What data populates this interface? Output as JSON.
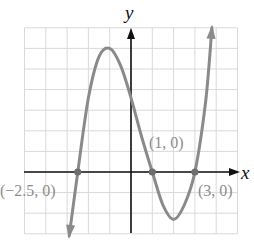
{
  "chart_data": {
    "type": "line",
    "title": "",
    "xlabel": "x",
    "ylabel": "y",
    "xlim": [
      -5,
      5
    ],
    "ylim": [
      -3,
      7
    ],
    "grid": true,
    "grid_step": 1,
    "series": [
      {
        "name": "cubic",
        "x": [
          -2.9,
          -2.5,
          -2.0,
          -1.5,
          -1.0,
          -0.5,
          0.0,
          0.5,
          1.0,
          1.5,
          2.0,
          2.5,
          3.0,
          3.5,
          3.8
        ],
        "values": [
          -3.1,
          0.0,
          3.6,
          5.6,
          6.0,
          5.2,
          3.6,
          1.7,
          0.0,
          -1.6,
          -2.3,
          -1.6,
          0.0,
          3.4,
          7.0
        ]
      }
    ],
    "points": [
      {
        "x": -2.5,
        "y": 0,
        "label": "(−2.5, 0)"
      },
      {
        "x": 1,
        "y": 0,
        "label": "(1, 0)"
      },
      {
        "x": 3,
        "y": 0,
        "label": "(3, 0)"
      }
    ],
    "colors": {
      "curve": "#8a8a8a",
      "axes": "#111111",
      "grid": "#d9d9d9",
      "labels": "#8c8c8c"
    }
  },
  "labels": {
    "x_axis": "x",
    "y_axis": "y",
    "root_left": "(−2.5, 0)",
    "root_mid": "(1, 0)",
    "root_right": "(3, 0)"
  }
}
